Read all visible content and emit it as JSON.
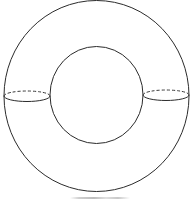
{
  "figure": {
    "stroke_color": "#2b2b2b",
    "background": "#ffffff",
    "outer_boundary": {
      "cx": 96.5,
      "cy": 96,
      "rx": 92.5,
      "ry": 96
    },
    "inner_boundary": {
      "cx": 96.5,
      "cy": 95,
      "rx": 47,
      "ry": 48.5
    },
    "cross_sections": [
      {
        "name": "left",
        "cx": 27,
        "cy": 96,
        "rx": 23,
        "ry": 5,
        "back_half": "dashed",
        "front_half": "solid"
      },
      {
        "name": "right",
        "cx": 166,
        "cy": 95,
        "rx": 23,
        "ry": 5,
        "back_half": "dashed",
        "front_half": "solid"
      }
    ],
    "caption": ""
  }
}
